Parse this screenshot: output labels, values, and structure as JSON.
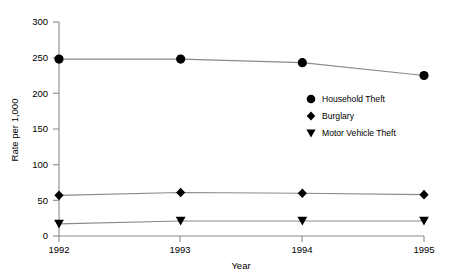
{
  "chart_data": {
    "type": "line",
    "title": "",
    "xlabel": "Year",
    "ylabel": "Rate per 1,000",
    "categories": [
      "1992",
      "1993",
      "1994",
      "1995"
    ],
    "x": [
      1992,
      1993,
      1994,
      1995
    ],
    "xlim": [
      1992,
      1995
    ],
    "ylim": [
      0,
      300
    ],
    "yticks": [
      "0",
      "50",
      "100",
      "150",
      "200",
      "250",
      "300"
    ],
    "ytick_values": [
      0,
      50,
      100,
      150,
      200,
      250,
      300
    ],
    "grid": false,
    "legend_position": "center-right",
    "series": [
      {
        "name": "Household Theft",
        "marker": "circle",
        "color": "#000000",
        "values": [
          248,
          248,
          243,
          225
        ]
      },
      {
        "name": "Burglary",
        "marker": "diamond",
        "color": "#000000",
        "values": [
          57,
          61,
          60,
          58
        ]
      },
      {
        "name": "Motor Vehicle Theft",
        "marker": "triangle-down",
        "color": "#000000",
        "values": [
          17,
          21,
          21,
          21
        ]
      }
    ]
  },
  "axes": {
    "y_title": "Rate per 1,000",
    "x_title": "Year",
    "ytick_0": "0",
    "ytick_1": "50",
    "ytick_2": "100",
    "ytick_3": "150",
    "ytick_4": "200",
    "ytick_5": "250",
    "ytick_6": "300",
    "xtick_0": "1992",
    "xtick_1": "1993",
    "xtick_2": "1994",
    "xtick_3": "1995"
  },
  "legend": {
    "items": [
      {
        "label": "Household Theft",
        "marker": "circle-marker-icon"
      },
      {
        "label": "Burglary",
        "marker": "diamond-marker-icon"
      },
      {
        "label": "Motor Vehicle Theft",
        "marker": "triangle-down-marker-icon"
      }
    ]
  },
  "style": {
    "axis_color": "#888888",
    "line_color": "#8a8a8a",
    "marker_color": "#000000",
    "background": "#ffffff"
  }
}
